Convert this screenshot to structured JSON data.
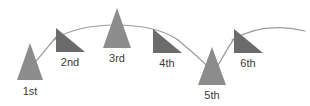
{
  "figure": {
    "title": "",
    "background_color": "#ffffff",
    "width": 310,
    "height": 106
  },
  "colors": {
    "light_triangle": "#8c8c8c",
    "dark_triangle": "#6b6b6b",
    "curve": "#9a9a9a",
    "label_text": "#3a3a3a"
  },
  "chart_data": {
    "type": "diagram",
    "title": "",
    "xlabel": "",
    "ylabel": "",
    "grid": false,
    "legend": null,
    "categories": [
      "1st",
      "2nd",
      "3rd",
      "4th",
      "5th",
      "6th"
    ],
    "markers": [
      {
        "label": "1st",
        "order": 1,
        "shape": "isosceles-triangle-up",
        "color": "#8c8c8c",
        "apex_x": 30,
        "apex_y": 43,
        "base_y": 80,
        "half_width": 13,
        "label_x": 30,
        "label_y": 95
      },
      {
        "label": "2nd",
        "order": 2,
        "shape": "right-triangle-apex-left",
        "color": "#6b6b6b",
        "apex_x": 56,
        "apex_y": 28,
        "base_y": 52,
        "right_x": 85,
        "label_x": 70,
        "label_y": 66
      },
      {
        "label": "3rd",
        "order": 3,
        "shape": "isosceles-triangle-up",
        "color": "#8c8c8c",
        "apex_x": 117,
        "apex_y": 8,
        "base_y": 48,
        "half_width": 14,
        "label_x": 117,
        "label_y": 62
      },
      {
        "label": "4th",
        "order": 4,
        "shape": "right-triangle-apex-left",
        "color": "#6b6b6b",
        "apex_x": 153,
        "apex_y": 29,
        "base_y": 53,
        "right_x": 182,
        "label_x": 167,
        "label_y": 67
      },
      {
        "label": "5th",
        "order": 5,
        "shape": "isosceles-triangle-up",
        "color": "#8c8c8c",
        "apex_x": 212,
        "apex_y": 47,
        "base_y": 85,
        "half_width": 14,
        "label_x": 212,
        "label_y": 99
      },
      {
        "label": "6th",
        "order": 6,
        "shape": "right-triangle-apex-left",
        "color": "#6b6b6b",
        "apex_x": 234,
        "apex_y": 29,
        "base_y": 53,
        "right_x": 263,
        "label_x": 248,
        "label_y": 67
      }
    ],
    "curves": [
      {
        "name": "arc-1-to-2",
        "path": "M 36 61 C 44 52 50 44 57 36"
      },
      {
        "name": "arc-2-to-4",
        "path": "M 54 40 C 80 20 152 20 178 40"
      },
      {
        "name": "arc-4-to-5",
        "path": "M 178 40 C 192 52 200 58 206 65"
      },
      {
        "name": "arc-5-to-6",
        "path": "M 218 65 C 224 56 228 46 235 38"
      },
      {
        "name": "arc-6-to-end",
        "path": "M 232 40 C 258 24 284 26 305 31"
      }
    ]
  }
}
